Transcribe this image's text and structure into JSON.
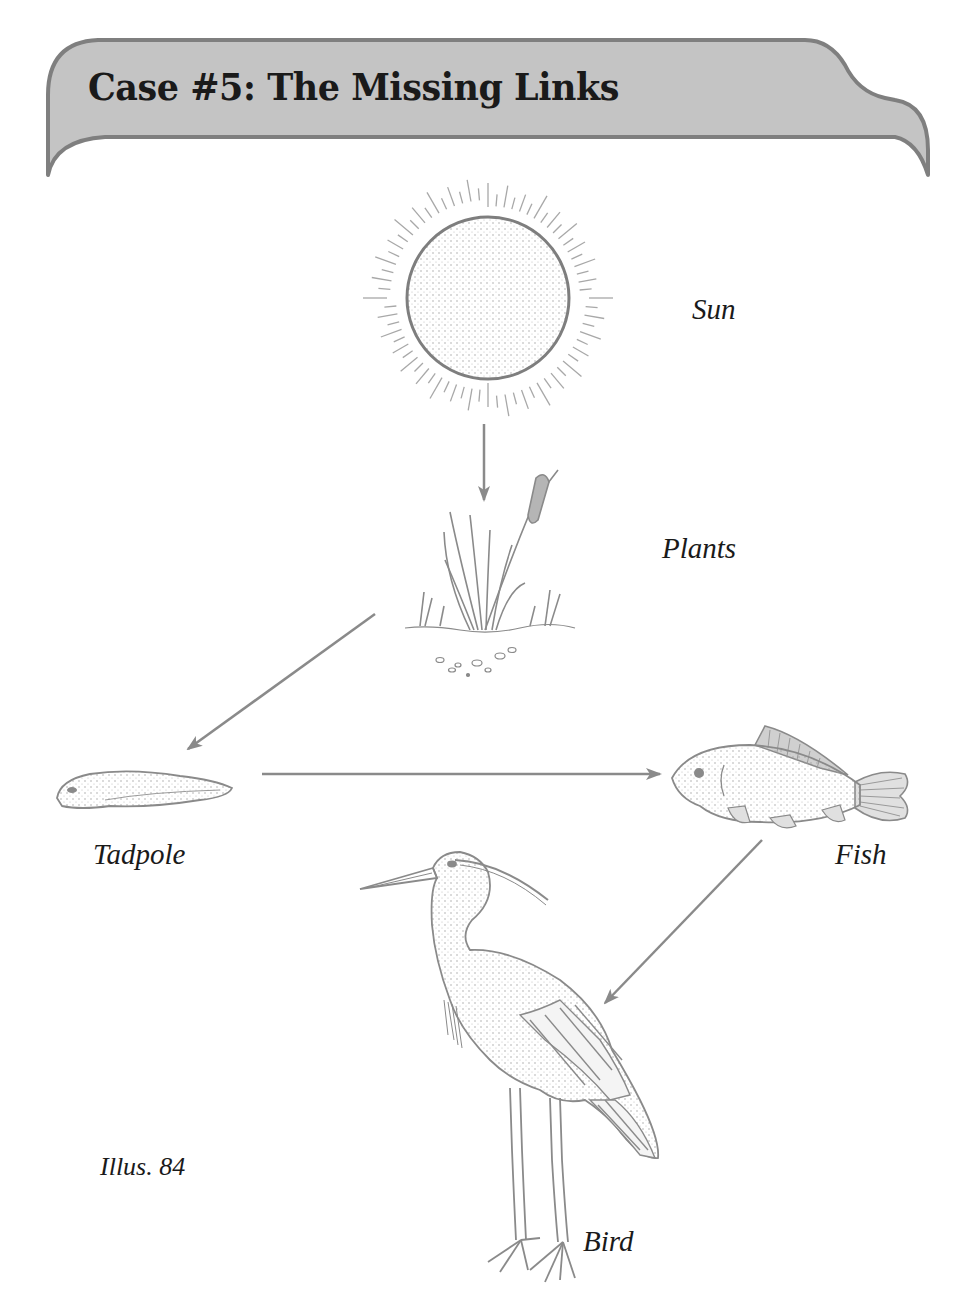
{
  "header": {
    "title": "Case #5: The Missing Links",
    "banner_fill": "#c4c4c4",
    "banner_stroke": "#7f7f7f"
  },
  "diagram": {
    "type": "food-chain",
    "nodes": [
      {
        "id": "sun",
        "label": "Sun",
        "icon": "sun-icon"
      },
      {
        "id": "plants",
        "label": "Plants",
        "icon": "cattail-plant-icon"
      },
      {
        "id": "tadpole",
        "label": "Tadpole",
        "icon": "tadpole-icon"
      },
      {
        "id": "fish",
        "label": "Fish",
        "icon": "fish-icon"
      },
      {
        "id": "bird",
        "label": "Bird",
        "icon": "heron-icon"
      }
    ],
    "edges": [
      {
        "from": "sun",
        "to": "plants"
      },
      {
        "from": "plants",
        "to": "tadpole"
      },
      {
        "from": "tadpole",
        "to": "fish"
      },
      {
        "from": "fish",
        "to": "bird"
      }
    ],
    "arrow_color": "#8a8a8a",
    "line_color": "#7a7a7a"
  },
  "caption": {
    "illustration": "Illus. 84"
  }
}
